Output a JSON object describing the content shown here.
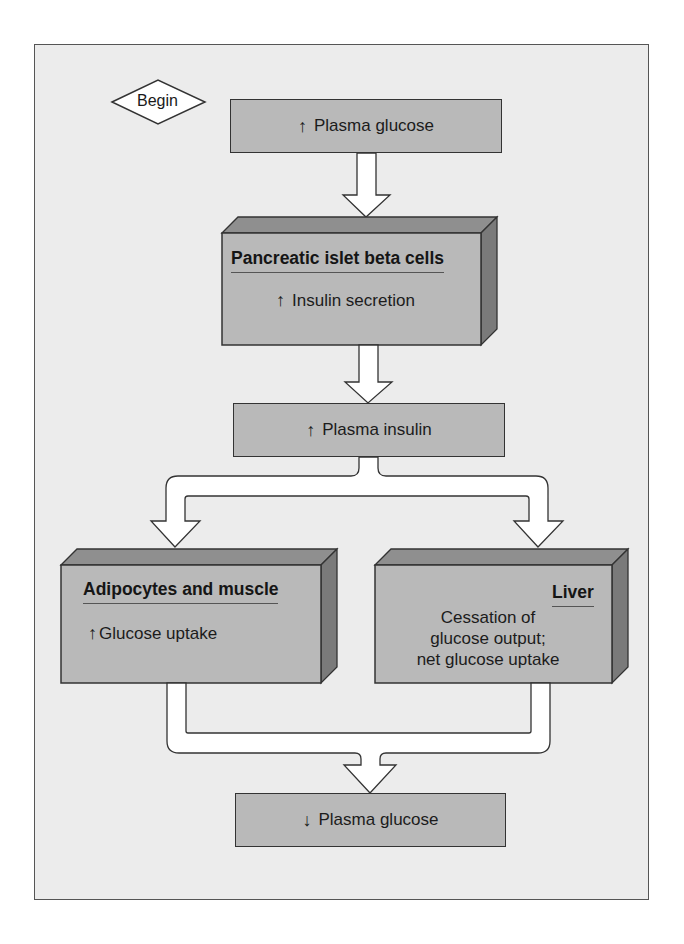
{
  "diagram": {
    "type": "flowchart",
    "start_label": "Begin",
    "nodes": [
      {
        "id": "plasma_glucose_up",
        "direction": "up",
        "arrow_symbol": "↑",
        "text": "Plasma glucose",
        "style": "flat"
      },
      {
        "id": "beta_cells",
        "title": "Pancreatic islet beta cells",
        "direction": "up",
        "arrow_symbol": "↑",
        "text": "Insulin secretion",
        "style": "3d"
      },
      {
        "id": "plasma_insulin_up",
        "direction": "up",
        "arrow_symbol": "↑",
        "text": "Plasma insulin",
        "style": "flat"
      },
      {
        "id": "adipocytes_muscle",
        "title": "Adipocytes and muscle",
        "direction": "up",
        "arrow_symbol": "↑",
        "text": "Glucose uptake",
        "style": "3d"
      },
      {
        "id": "liver",
        "title": "Liver",
        "text_lines": [
          "Cessation of",
          "glucose output;",
          "net glucose uptake"
        ],
        "style": "3d"
      },
      {
        "id": "plasma_glucose_down",
        "direction": "down",
        "arrow_symbol": "↓",
        "text": "Plasma glucose",
        "style": "flat"
      }
    ],
    "edges": [
      {
        "from": "plasma_glucose_up",
        "to": "beta_cells"
      },
      {
        "from": "beta_cells",
        "to": "plasma_insulin_up"
      },
      {
        "from": "plasma_insulin_up",
        "to": "adipocytes_muscle"
      },
      {
        "from": "plasma_insulin_up",
        "to": "liver"
      },
      {
        "from": "adipocytes_muscle",
        "to": "plasma_glucose_down"
      },
      {
        "from": "liver",
        "to": "plasma_glucose_down"
      }
    ]
  },
  "colors": {
    "background": "#ececec",
    "box_front": "#b9b9b9",
    "box_top": "#8f8f8f",
    "box_side": "#7a7a7a",
    "arrow_fill": "#ffffff",
    "outline": "#333333"
  }
}
